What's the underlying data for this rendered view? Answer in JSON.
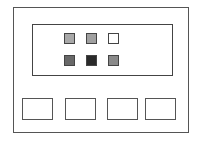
{
  "diagram": {
    "squares": [
      {
        "row": 0,
        "col": 0,
        "color": "#a8a8a8"
      },
      {
        "row": 0,
        "col": 1,
        "color": "#a0a0a0"
      },
      {
        "row": 0,
        "col": 2,
        "color": "#ffffff"
      },
      {
        "row": 1,
        "col": 0,
        "color": "#686868"
      },
      {
        "row": 1,
        "col": 1,
        "color": "#2a2a2a"
      },
      {
        "row": 1,
        "col": 2,
        "color": "#8a8a8a"
      }
    ],
    "bottom_boxes": 4
  }
}
